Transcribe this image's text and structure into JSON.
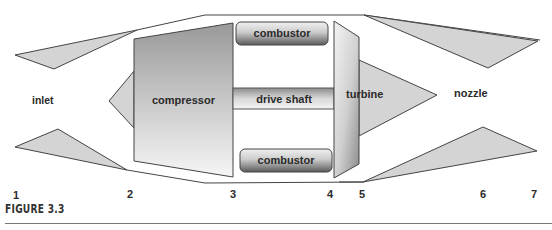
{
  "figure": {
    "caption": "FIGURE 3.3"
  },
  "components": {
    "inlet": "inlet",
    "compressor": "compressor",
    "combustor_top": "combustor",
    "combustor_bottom": "combustor",
    "drive_shaft": "drive shaft",
    "turbine": "turbine",
    "nozzle": "nozzle"
  },
  "stations": [
    "1",
    "2",
    "3",
    "4",
    "5",
    "6",
    "7"
  ],
  "colors": {
    "fill_light": "#d4d4d4",
    "stroke": "#444444",
    "gradient_dark": "#8a8a8a",
    "gradient_light": "#f4f4f4"
  }
}
